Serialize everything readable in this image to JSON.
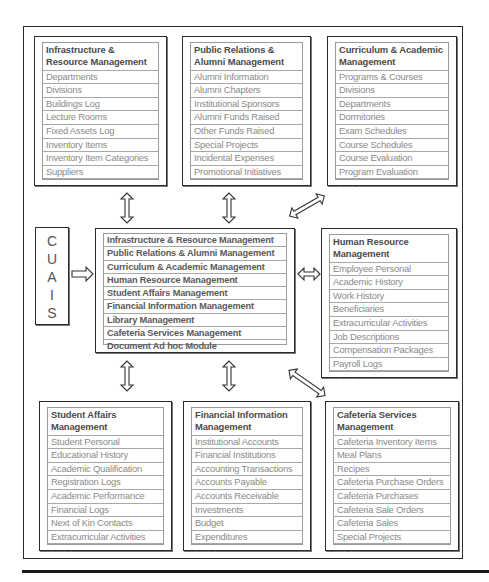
{
  "diagram": {
    "system_label": [
      "C",
      "U",
      "A",
      "I",
      "S"
    ],
    "core": {
      "items": [
        "Infrastructure & Resource Management",
        "Public Relations & Alumni Management",
        "Curriculum & Academic Management",
        "Human Resource Management",
        "Student Affairs Management",
        "Financial Information Management",
        "Library Management",
        "Cafeteria Services Management",
        "Document Ad hoc Module"
      ]
    },
    "modules": {
      "infrastructure": {
        "title": "Infrastructure & Resource Management",
        "items": [
          "Departments",
          "Divisions",
          "Buildings Log",
          "Lecture Rooms",
          "Fixed Assets Log",
          "Inventory Items",
          "Inventory Item Categories",
          "Suppliers",
          ". . . ."
        ]
      },
      "public_relations": {
        "title": "Public Relations & Alumni Management",
        "items": [
          "Alumni Information",
          "Alumni Chapters",
          "Institutional Sponsors",
          "Alumni Funds Raised",
          "Other Funds Raised",
          "Special Projects",
          "Incidental Expenses",
          "Promotional Initiatives",
          ". . . ."
        ]
      },
      "curriculum": {
        "title": "Curriculum & Academic Management",
        "items": [
          "Programs & Courses",
          "Divisions",
          "Departments",
          "Dormitories",
          "Exam Schedules",
          "Course Schedules",
          "Course Evaluation",
          "Program Evaluation",
          ". . . ."
        ]
      },
      "human_resource": {
        "title": "Human Resource Management",
        "items": [
          "Employee Personal",
          "Academic History",
          "Work History",
          "Beneficiaries",
          "Extracurricular Activities",
          "Job Descriptions",
          "Compensation Packages",
          "Payroll Logs",
          ". . . ."
        ]
      },
      "student_affairs": {
        "title": "Student Affairs Management",
        "items": [
          "Student Personal",
          "Educational History",
          "Academic Qualification",
          "Registration Logs",
          "Academic Performance",
          "Financial Logs",
          "Next of Kin Contacts",
          "Extracurricular Activities",
          ". . . ."
        ]
      },
      "financial": {
        "title": "Financial Information Management",
        "items": [
          "Institutional Accounts",
          "Financial Institutions",
          "Accounting Transactions",
          "Accounts Payable",
          "Accounts Receivable",
          "Investments",
          "Budget",
          "Expenditures",
          ". . . ."
        ]
      },
      "cafeteria": {
        "title": "Cafeteria Services Management",
        "items": [
          "Cafeteria Inventory Items",
          "Meal Plans",
          "Recipes",
          "Cafeteria Purchase Orders",
          "Cafeteria Purchases",
          "Cafeteria Sale Orders",
          "Cafeteria Sales",
          "Special Projects",
          ". . . ."
        ]
      }
    },
    "colors": {
      "border": "#2a2a2a",
      "grid": "#a8a8a8",
      "title_text": "#4a4a4a",
      "item_text": "#8a8a8a"
    }
  }
}
